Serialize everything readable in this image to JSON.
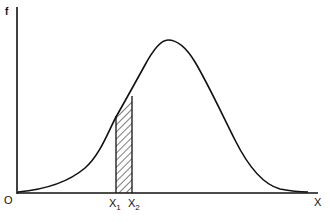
{
  "diagram": {
    "type": "normal-distribution-curve",
    "axes": {
      "y_label": "f",
      "x_label": "X",
      "origin_label": "O"
    },
    "shaded_region": {
      "left_label": "X",
      "left_subscript": "1",
      "right_label": "X",
      "right_subscript": "2",
      "pattern": "diagonal-hatch"
    },
    "colors": {
      "line": "#111111",
      "background": "#ffffff"
    }
  }
}
